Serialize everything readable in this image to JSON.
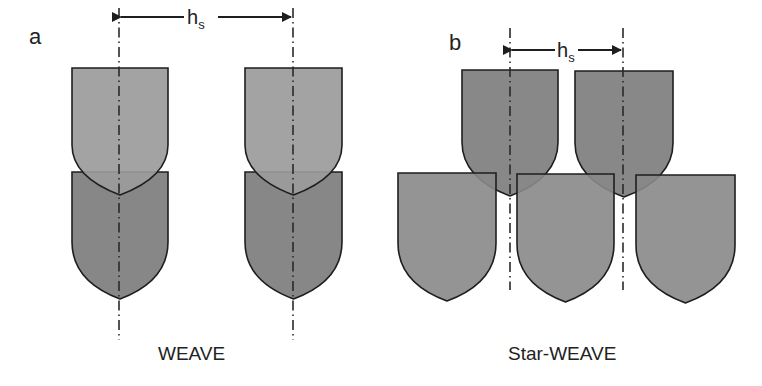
{
  "panels": [
    {
      "id": "a",
      "label": "a",
      "caption": "WEAVE",
      "spacing_label": "h",
      "spacing_subscript": "s",
      "axes_x": [
        119,
        293
      ],
      "upper_shields": [
        {
          "x": 72,
          "y": 68,
          "w": 96,
          "straight": 77,
          "tip": 127,
          "fill": "#9b9b9b"
        },
        {
          "x": 245,
          "y": 68,
          "w": 97,
          "straight": 77,
          "tip": 127,
          "fill": "#9b9b9b"
        }
      ],
      "lower_shields": [
        {
          "x": 72,
          "y": 172,
          "w": 96,
          "straight": 70,
          "tip": 127,
          "fill": "#878787"
        },
        {
          "x": 245,
          "y": 172,
          "w": 97,
          "straight": 70,
          "tip": 127,
          "fill": "#878787"
        }
      ]
    },
    {
      "id": "b",
      "label": "b",
      "caption": "Star-WEAVE",
      "spacing_label": "h",
      "spacing_subscript": "s",
      "axes_x": [
        510,
        623
      ],
      "upper_shields": [
        {
          "x": 462,
          "y": 70,
          "w": 96,
          "straight": 72,
          "tip": 126,
          "fill": "#888888"
        },
        {
          "x": 575,
          "y": 71,
          "w": 98,
          "straight": 72,
          "tip": 126,
          "fill": "#888888"
        }
      ],
      "lower_shields": [
        {
          "x": 398,
          "y": 173,
          "w": 98,
          "straight": 70,
          "tip": 128,
          "fill": "#888888"
        },
        {
          "x": 517,
          "y": 174,
          "w": 97,
          "straight": 70,
          "tip": 128,
          "fill": "#888888"
        },
        {
          "x": 636,
          "y": 175,
          "w": 99,
          "straight": 70,
          "tip": 128,
          "fill": "#888888"
        }
      ]
    }
  ],
  "colors": {
    "stroke": "#1e1e1e",
    "axis": "#2a2a2a",
    "text": "#222222"
  }
}
